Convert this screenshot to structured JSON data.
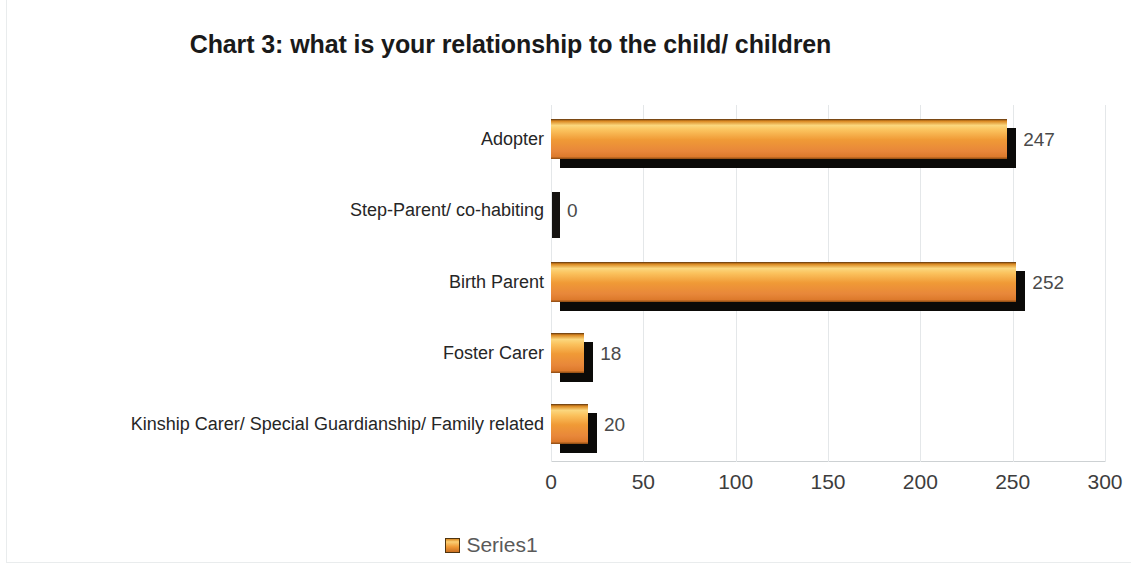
{
  "chart_data": {
    "type": "bar",
    "orientation": "horizontal",
    "title": "Chart 3: what is your relationship to the child/ children",
    "xlabel": "",
    "ylabel": "",
    "xlim": [
      0,
      300
    ],
    "xticks": [
      "0",
      "50",
      "100",
      "150",
      "200",
      "250",
      "300"
    ],
    "grid": "vertical",
    "legend_position": "bottom",
    "categories": [
      "Adopter",
      "Step-Parent/ co-habiting",
      "Birth Parent",
      "Foster Carer",
      "Kinship Carer/ Special Guardianship/ Family related"
    ],
    "values": [
      247,
      0,
      252,
      18,
      20
    ],
    "data_labels": [
      "247",
      "0",
      "252",
      "18",
      "20"
    ],
    "series": [
      {
        "name": "Series1",
        "values": [
          247,
          0,
          252,
          18,
          20
        ]
      }
    ],
    "colors": {
      "bar_highlight": "#fbd77e",
      "bar_mid": "#f09a36",
      "bar_deep": "#dd7a2c",
      "bar_shadow": "#0b0a08",
      "gridline": "#e4e7e9",
      "axis": "#cdd1d3",
      "title_text": "#1a1a1a",
      "category_text": "#262626",
      "tick_text": "#3d3d3d",
      "value_label_text": "#4a4a4a",
      "legend_text": "#5a5a5a",
      "background": "#ffffff"
    }
  },
  "legend": {
    "entries": [
      {
        "label": "Series1",
        "swatch": "orange-gradient-swatch"
      }
    ]
  }
}
